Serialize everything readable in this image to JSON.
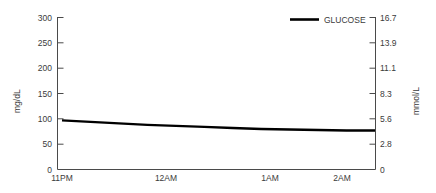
{
  "chart_data": {
    "type": "line",
    "title": "",
    "xlabel": "",
    "ylabel": "mg/dL",
    "y2label": "mmol/L",
    "grid": false,
    "legend_position": "top-right",
    "series": [
      {
        "name": "GLUCOSE",
        "color": "#000000",
        "x": [
          "11PM",
          "11:20PM",
          "11:40PM",
          "12AM",
          "12:20AM",
          "12:40AM",
          "1AM",
          "1:20AM",
          "1:40AM",
          "2AM",
          "2:20AM",
          "2:30AM"
        ],
        "values": [
          97,
          94,
          91,
          88,
          86,
          84,
          82,
          80,
          79,
          78,
          77,
          77
        ]
      }
    ],
    "xlim": [
      "11PM",
      "2:30AM"
    ],
    "ylim": [
      0,
      300
    ],
    "y2lim": [
      0,
      16.7
    ],
    "xticks": [
      "11PM",
      "12AM",
      "1AM",
      "2AM"
    ],
    "yticks": [
      "300",
      "250",
      "200",
      "150",
      "100",
      "50",
      "0"
    ],
    "y2ticks": [
      "16.7",
      "13.9",
      "11.1",
      "8.3",
      "5.6",
      "2.8",
      "0"
    ]
  },
  "axes": {
    "left": {
      "title": "mg/dL",
      "ticks": [
        "300",
        "250",
        "200",
        "150",
        "100",
        "50",
        "0"
      ]
    },
    "right": {
      "title": "mmol/L",
      "ticks": [
        "16.7",
        "13.9",
        "11.1",
        "8.3",
        "5.6",
        "2.8",
        "0"
      ]
    },
    "bottom": {
      "ticks": [
        "11PM",
        "12AM",
        "1AM",
        "2AM"
      ]
    }
  },
  "legend": {
    "items": [
      {
        "label": "GLUCOSE",
        "color": "#000000"
      }
    ]
  }
}
